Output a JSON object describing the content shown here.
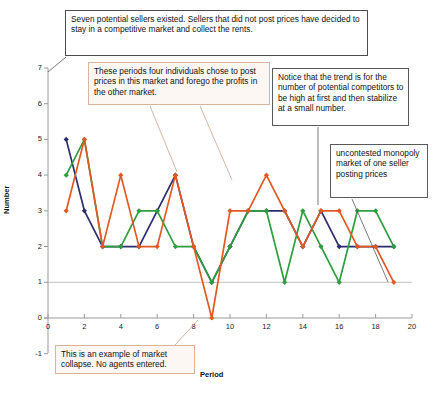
{
  "chart_data": {
    "type": "line",
    "title": "",
    "xlabel": "Period",
    "ylabel": "Number",
    "xlim": [
      0,
      20
    ],
    "ylim": [
      -1,
      7
    ],
    "xticks": [
      0,
      2,
      4,
      6,
      8,
      10,
      12,
      14,
      16,
      18,
      20
    ],
    "yticks": [
      -1,
      0,
      1,
      2,
      3,
      4,
      5,
      6,
      7
    ],
    "grid": "horizontal gridline at y=1 only",
    "legend": "none",
    "x": [
      1,
      2,
      3,
      4,
      5,
      6,
      7,
      8,
      9,
      10,
      11,
      12,
      13,
      14,
      15,
      16,
      17,
      18,
      19
    ],
    "series": [
      {
        "name": "navy-series",
        "color": "#2b2d6e",
        "marker": "diamond",
        "values": [
          5,
          3,
          2,
          2,
          2,
          3,
          4,
          2,
          1,
          2,
          3,
          3,
          3,
          2,
          3,
          2,
          2,
          2,
          2
        ]
      },
      {
        "name": "green-series",
        "color": "#2f9e3f",
        "marker": "diamond",
        "values": [
          4,
          5,
          2,
          2,
          3,
          3,
          2,
          2,
          1,
          2,
          3,
          3,
          1,
          3,
          2,
          1,
          3,
          3,
          2
        ]
      },
      {
        "name": "orange-series",
        "color": "#e25822",
        "marker": "diamond",
        "values": [
          3,
          5,
          2,
          4,
          2,
          2,
          4,
          2,
          0,
          3,
          3,
          4,
          3,
          2,
          3,
          3,
          2,
          2,
          1
        ]
      }
    ],
    "colors": {
      "navy": "#2b2d6e",
      "green": "#2f9e3f",
      "orange": "#e25822",
      "axis": "#8a8a8a",
      "gridline": "#bbbbbb"
    }
  },
  "annotations": {
    "sellers": "Seven potential sellers existed.  Sellers that did not post prices have decided to stay in a competitive market and collect the rents.",
    "periods": "These periods four individuals chose to post prices in this market and forego the profits in the other market.",
    "trend": "Notice that the trend is for the number of potential competitors to be high at first and then stabilize at a small number.",
    "monopoly": "uncontested monopoly market of one seller posting prices",
    "collapse": "This is an example of market collapse. No agents entered."
  },
  "axis": {
    "y_title": "Number",
    "x_title": "Period",
    "y_tick_labels": [
      "7",
      "6",
      "5",
      "4",
      "3",
      "2",
      "1",
      "0",
      "-1"
    ],
    "x_tick_labels": [
      "0",
      "2",
      "4",
      "6",
      "8",
      "10",
      "12",
      "14",
      "16",
      "18",
      "20"
    ]
  }
}
